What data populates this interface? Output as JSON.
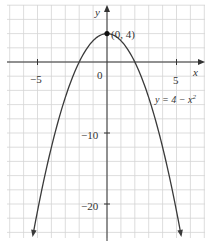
{
  "chart_data": {
    "type": "line",
    "title": "",
    "xlabel": "x",
    "ylabel": "y",
    "xlim": [
      -7.1,
      7.1
    ],
    "ylim": [
      -25,
      8
    ],
    "grid": true,
    "x_grid_step": 1,
    "y_grid_step": 2,
    "x_ticks": [
      {
        "value": -5,
        "label": "−5"
      },
      {
        "value": 0,
        "label": "0"
      },
      {
        "value": 5,
        "label": "5"
      }
    ],
    "y_ticks": [
      {
        "value": -10,
        "label": "−10"
      },
      {
        "value": -20,
        "label": "−20"
      }
    ],
    "series": [
      {
        "name": "y = 4 − x²",
        "equation": "y = 4 - x^2",
        "x": [
          -5.3,
          -5,
          -4,
          -3,
          -2,
          -1,
          0,
          1,
          2,
          3,
          4,
          5,
          5.3
        ],
        "y": [
          -24.09,
          -21,
          -12,
          -5,
          0,
          3,
          4,
          3,
          0,
          -5,
          -12,
          -21,
          -24.09
        ],
        "arrows_at_ends": true
      }
    ],
    "annotations": [
      {
        "text": "(0, 4)",
        "x": 0,
        "y": 4,
        "marker": "point"
      },
      {
        "text": "y = 4 − x²",
        "x": 4.2,
        "y": -5.5
      }
    ]
  },
  "labels": {
    "x_axis": "x",
    "y_axis": "y",
    "vertex": "(0, 4)",
    "equation_main": "y = 4 − x",
    "equation_sup": "2",
    "tick_x_neg5": "−5",
    "tick_x_0": "0",
    "tick_x_5": "5",
    "tick_y_neg10": "−10",
    "tick_y_neg20": "−20"
  },
  "colors": {
    "curve": "#3a3a3a",
    "axis": "#333333",
    "grid": "#d4d4d4"
  }
}
